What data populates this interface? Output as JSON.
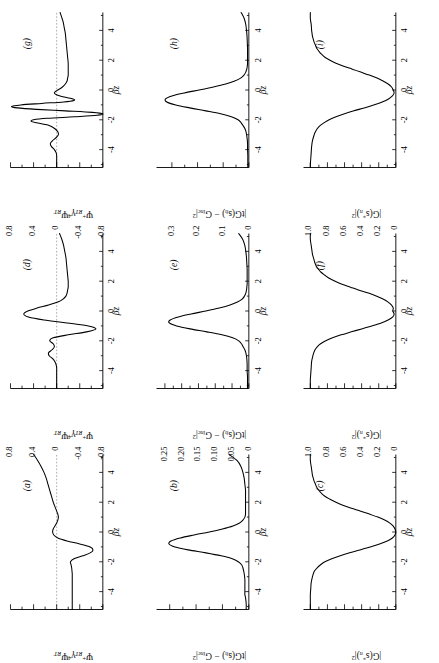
{
  "figure": {
    "type": "multi-panel-scientific-plot",
    "rotation_deg": -90,
    "grid": {
      "rows": 3,
      "cols": 3
    },
    "xlabel": "βz",
    "x_ticks": [
      "-4",
      "-2",
      "0",
      "2",
      "4"
    ],
    "xlim": [
      -5.2,
      5.2
    ]
  },
  "chart_data": [
    {
      "id": "a",
      "type": "line",
      "tag": "(a)",
      "title": "",
      "xlabel": "βz",
      "ylabel_html": "Ψ<sup>+</sup><sub>RT</sub>γ<sup class=\"up\">4</sup>Ψ<sub>RT</sub>",
      "ylabel_text": "Ψ+RT γ4 ΨRT",
      "xlim": [
        -5.2,
        5.2
      ],
      "ylim": [
        -0.8,
        0.8
      ],
      "y_ticks": [
        "0.8",
        "0.4",
        "0",
        "-0.4",
        "-0.8"
      ],
      "y_tick_values": [
        0.8,
        0.4,
        0,
        -0.4,
        -0.8
      ],
      "zero_reference_line": true,
      "x": [
        -5.2,
        -4.8,
        -4.4,
        -4.0,
        -3.6,
        -3.2,
        -3.0,
        -2.8,
        -2.6,
        -2.4,
        -2.2,
        -2.0,
        -1.8,
        -1.6,
        -1.4,
        -1.2,
        -1.0,
        -0.8,
        -0.6,
        -0.4,
        -0.2,
        0.0,
        0.2,
        0.4,
        0.6,
        0.8,
        1.0,
        1.2,
        1.4,
        1.6,
        1.8,
        2.0,
        2.4,
        2.8,
        3.2,
        3.6,
        4.0,
        4.4,
        4.8,
        5.2
      ],
      "y": [
        -0.27,
        -0.27,
        -0.27,
        -0.27,
        -0.27,
        -0.27,
        -0.27,
        -0.27,
        -0.265,
        -0.26,
        -0.25,
        -0.24,
        -0.3,
        -0.45,
        -0.58,
        -0.63,
        -0.58,
        -0.4,
        -0.18,
        -0.02,
        0.05,
        0.07,
        0.06,
        0.03,
        0.0,
        -0.02,
        -0.03,
        -0.02,
        0.0,
        0.02,
        0.04,
        0.06,
        0.09,
        0.12,
        0.15,
        0.18,
        0.22,
        0.27,
        0.33,
        0.4
      ]
    },
    {
      "id": "b",
      "type": "line",
      "tag": "(b)",
      "xlabel": "βz",
      "ylabel_html": "|tG(s<sub>h</sub>) − G<sub>inc</sub>|<sup>2</sup>",
      "ylabel_text": "|tG(s_h) - G_inc|^2",
      "xlim": [
        -5.2,
        5.2
      ],
      "ylim": [
        0,
        0.14
      ],
      "y_ticks": [
        "0.12",
        "0.08",
        "0.04",
        "0"
      ],
      "y_tick_values": [
        0.12,
        0.08,
        0.04,
        0
      ],
      "zero_reference_line": false,
      "x": [
        -5.2,
        -4.8,
        -4.4,
        -4.2,
        -4.0,
        -3.6,
        -3.2,
        -2.8,
        -2.4,
        -2.2,
        -2.0,
        -1.8,
        -1.6,
        -1.4,
        -1.2,
        -1.0,
        -0.8,
        -0.6,
        -0.4,
        -0.2,
        0.0,
        0.2,
        0.4,
        0.6,
        0.8,
        1.0,
        1.2,
        1.4,
        1.6,
        1.8,
        2.0,
        2.4,
        2.8,
        3.2,
        3.6,
        4.0,
        4.4,
        4.8,
        5.2
      ],
      "y": [
        0.004,
        0.004,
        0.005,
        0.006,
        0.006,
        0.006,
        0.006,
        0.007,
        0.009,
        0.011,
        0.016,
        0.025,
        0.042,
        0.065,
        0.092,
        0.112,
        0.121,
        0.118,
        0.104,
        0.083,
        0.06,
        0.04,
        0.024,
        0.014,
        0.009,
        0.006,
        0.005,
        0.005,
        0.005,
        0.005,
        0.005,
        0.005,
        0.005,
        0.006,
        0.007,
        0.009,
        0.012,
        0.018,
        0.03
      ]
    },
    {
      "id": "c",
      "type": "line",
      "tag": "(c)",
      "xlabel": "βz",
      "ylabel_html": "|G(s<sup>*</sup><sub>n</sub>)|<sup>2</sup>",
      "ylabel_text": "|G(s*_n)|^2",
      "xlim": [
        -5.2,
        5.2
      ],
      "ylim": [
        0,
        1.08
      ],
      "y_ticks": [
        "1.0",
        "0.8",
        "0.6",
        "0.4",
        "0.2",
        "0"
      ],
      "y_tick_values": [
        1.0,
        0.8,
        0.6,
        0.4,
        0.2,
        0
      ],
      "zero_reference_line": false,
      "x": [
        -5.2,
        -5.0,
        -4.6,
        -4.2,
        -3.8,
        -3.4,
        -3.0,
        -2.8,
        -2.6,
        -2.4,
        -2.2,
        -2.0,
        -1.8,
        -1.6,
        -1.4,
        -1.2,
        -1.0,
        -0.8,
        -0.6,
        -0.4,
        -0.2,
        0.0,
        0.2,
        0.4,
        0.6,
        0.8,
        1.0,
        1.2,
        1.4,
        1.6,
        1.8,
        2.0,
        2.2,
        2.4,
        2.6,
        2.8,
        3.0,
        3.2,
        3.4,
        3.6,
        3.8,
        4.0,
        4.4,
        4.8,
        5.2
      ],
      "y": [
        1.0,
        1.0,
        1.0,
        1.0,
        0.995,
        0.99,
        0.975,
        0.965,
        0.95,
        0.92,
        0.88,
        0.83,
        0.75,
        0.65,
        0.54,
        0.42,
        0.3,
        0.19,
        0.1,
        0.04,
        0.01,
        0.0,
        0.01,
        0.03,
        0.07,
        0.13,
        0.21,
        0.31,
        0.41,
        0.52,
        0.62,
        0.7,
        0.77,
        0.83,
        0.87,
        0.9,
        0.925,
        0.94,
        0.955,
        0.965,
        0.975,
        0.98,
        0.99,
        1.0,
        1.0
      ]
    },
    {
      "id": "d",
      "type": "line",
      "tag": "(d)",
      "xlabel": "βz",
      "ylabel_html": "Ψ<sup>+</sup><sub>RT</sub>γ<sup class=\"up\">4</sup>Ψ<sub>RT</sub>",
      "ylabel_text": "Ψ+RT γ4 ΨRT",
      "xlim": [
        -5.2,
        5.2
      ],
      "ylim": [
        -0.8,
        0.8
      ],
      "y_ticks": [
        "0.8",
        "0.4",
        "0",
        "-0.4",
        "-0.8"
      ],
      "y_tick_values": [
        0.8,
        0.4,
        0,
        -0.4,
        -0.8
      ],
      "zero_reference_line": true,
      "x": [
        -5.2,
        -4.6,
        -4.2,
        -3.8,
        -3.6,
        -3.4,
        -3.2,
        -3.0,
        -2.8,
        -2.6,
        -2.4,
        -2.2,
        -2.0,
        -1.8,
        -1.6,
        -1.4,
        -1.2,
        -1.0,
        -0.8,
        -0.6,
        -0.4,
        -0.2,
        0.0,
        0.2,
        0.4,
        0.6,
        0.8,
        1.0,
        1.2,
        1.4,
        1.6,
        1.8,
        2.0,
        2.4,
        2.8,
        3.2,
        3.6,
        4.0,
        4.4,
        4.8,
        5.2
      ],
      "y": [
        0.0,
        0.0,
        0.0,
        0.0,
        0.01,
        0.03,
        0.07,
        0.13,
        0.14,
        0.08,
        0.04,
        0.06,
        0.12,
        0.06,
        -0.2,
        -0.52,
        -0.68,
        -0.55,
        -0.18,
        0.22,
        0.49,
        0.57,
        0.5,
        0.34,
        0.14,
        -0.02,
        -0.11,
        -0.16,
        -0.18,
        -0.19,
        -0.2,
        -0.2,
        -0.2,
        -0.19,
        -0.18,
        -0.17,
        -0.16,
        -0.14,
        -0.12,
        -0.09,
        -0.05
      ]
    },
    {
      "id": "e",
      "type": "line",
      "tag": "(e)",
      "xlabel": "βz",
      "ylabel_html": "|tG(s<sub>h</sub>) − G<sub>inc</sub>|<sup>2</sup>",
      "ylabel_text": "|tG(s_h) - G_inc|^2",
      "xlim": [
        -5.2,
        5.2
      ],
      "ylim": [
        0,
        0.275
      ],
      "y_ticks": [
        "0.25",
        "0.20",
        "0.15",
        "0.10",
        "0.05",
        "0"
      ],
      "y_tick_values": [
        0.25,
        0.2,
        0.15,
        0.1,
        0.05,
        0
      ],
      "zero_reference_line": false,
      "x": [
        -5.2,
        -4.8,
        -4.4,
        -4.0,
        -3.6,
        -3.2,
        -2.8,
        -2.6,
        -2.4,
        -2.2,
        -2.0,
        -1.8,
        -1.6,
        -1.4,
        -1.2,
        -1.0,
        -0.8,
        -0.6,
        -0.4,
        -0.2,
        0.0,
        0.2,
        0.4,
        0.6,
        0.8,
        1.0,
        1.2,
        1.4,
        1.6,
        1.8,
        2.0,
        2.4,
        2.8,
        3.2,
        3.6,
        4.0,
        4.4,
        4.8,
        5.2
      ],
      "y": [
        0.004,
        0.004,
        0.004,
        0.005,
        0.005,
        0.006,
        0.009,
        0.012,
        0.017,
        0.022,
        0.03,
        0.048,
        0.08,
        0.125,
        0.175,
        0.215,
        0.237,
        0.234,
        0.21,
        0.172,
        0.128,
        0.088,
        0.056,
        0.034,
        0.02,
        0.013,
        0.009,
        0.007,
        0.006,
        0.005,
        0.005,
        0.005,
        0.005,
        0.006,
        0.007,
        0.009,
        0.012,
        0.018,
        0.03
      ]
    },
    {
      "id": "f",
      "type": "line",
      "tag": "(f)",
      "xlabel": "βz",
      "ylabel_html": "|G(s<sup>*</sup><sub>n</sub>)|<sup>2</sup>",
      "ylabel_text": "|G(s*_n)|^2",
      "xlim": [
        -5.2,
        5.2
      ],
      "ylim": [
        0,
        1.08
      ],
      "y_ticks": [
        "1.0",
        "0.8",
        "0.6",
        "0.4",
        "0.2",
        "0"
      ],
      "y_tick_values": [
        1.0,
        0.8,
        0.6,
        0.4,
        0.2,
        0
      ],
      "zero_reference_line": false,
      "x": [
        -5.2,
        -5.0,
        -4.6,
        -4.2,
        -3.8,
        -3.4,
        -3.0,
        -2.8,
        -2.6,
        -2.4,
        -2.2,
        -2.0,
        -1.8,
        -1.6,
        -1.4,
        -1.2,
        -1.0,
        -0.8,
        -0.6,
        -0.4,
        -0.2,
        0.0,
        0.2,
        0.4,
        0.6,
        0.8,
        1.0,
        1.2,
        1.4,
        1.6,
        1.8,
        2.0,
        2.2,
        2.4,
        2.6,
        2.8,
        3.0,
        3.2,
        3.4,
        3.6,
        3.8,
        4.0,
        4.4,
        4.8,
        5.2
      ],
      "y": [
        1.0,
        1.0,
        1.0,
        0.995,
        0.99,
        0.985,
        0.97,
        0.96,
        0.945,
        0.92,
        0.88,
        0.82,
        0.74,
        0.64,
        0.52,
        0.4,
        0.28,
        0.17,
        0.09,
        0.035,
        0.02,
        0.035,
        0.03,
        0.05,
        0.09,
        0.15,
        0.23,
        0.32,
        0.43,
        0.53,
        0.63,
        0.71,
        0.78,
        0.83,
        0.875,
        0.905,
        0.93,
        0.945,
        0.955,
        0.965,
        0.975,
        0.98,
        0.99,
        1.0,
        1.0
      ]
    },
    {
      "id": "g",
      "type": "line",
      "tag": "(g)",
      "xlabel": "βz",
      "ylabel_html": "Ψ<sup>+</sup><sub>RT</sub>γ<sup class=\"up\">4</sup>Ψ<sub>RT</sub>",
      "ylabel_text": "Ψ+RT γ4 ΨRT",
      "xlim": [
        -5.2,
        5.2
      ],
      "ylim": [
        -0.8,
        0.8
      ],
      "y_ticks": [
        "0.8",
        "0.4",
        "0",
        "-0.4",
        "-0.8"
      ],
      "y_tick_values": [
        0.8,
        0.4,
        0,
        -0.4,
        -0.8
      ],
      "zero_reference_line": true,
      "x": [
        -5.2,
        -4.8,
        -4.4,
        -4.2,
        -4.0,
        -3.8,
        -3.6,
        -3.4,
        -3.2,
        -3.0,
        -2.8,
        -2.6,
        -2.4,
        -2.3,
        -2.2,
        -2.1,
        -2.0,
        -1.9,
        -1.8,
        -1.7,
        -1.6,
        -1.5,
        -1.4,
        -1.3,
        -1.2,
        -1.1,
        -1.0,
        -0.9,
        -0.8,
        -0.7,
        -0.6,
        -0.5,
        -0.4,
        -0.3,
        -0.2,
        -0.1,
        0.0,
        0.2,
        0.4,
        0.6,
        0.8,
        1.0,
        1.4,
        1.8,
        2.2,
        2.6,
        3.0,
        3.4,
        3.8,
        4.2,
        4.6,
        5.2
      ],
      "y": [
        0.0,
        0.0,
        0.0,
        0.01,
        0.04,
        0.09,
        0.11,
        0.07,
        0.01,
        -0.03,
        -0.02,
        0.03,
        0.12,
        0.22,
        0.35,
        0.44,
        0.4,
        0.16,
        -0.3,
        -0.7,
        -0.8,
        -0.62,
        -0.15,
        0.35,
        0.68,
        0.78,
        0.62,
        0.26,
        -0.12,
        -0.3,
        -0.28,
        -0.17,
        -0.06,
        0.01,
        0.04,
        0.02,
        -0.02,
        -0.1,
        -0.15,
        -0.18,
        -0.19,
        -0.2,
        -0.2,
        -0.2,
        -0.19,
        -0.18,
        -0.17,
        -0.16,
        -0.15,
        -0.13,
        -0.11,
        -0.06
      ]
    },
    {
      "id": "h",
      "type": "line",
      "tag": "(h)",
      "xlabel": "βz",
      "ylabel_html": "|tG(s<sub>h</sub>) − G<sub>inc</sub>|<sup>2</sup>",
      "ylabel_text": "|tG(s_h) - G_inc|^2",
      "xlim": [
        -5.2,
        5.2
      ],
      "ylim": [
        0,
        0.36
      ],
      "y_ticks": [
        "0.3",
        "0.2",
        "0.1",
        "0"
      ],
      "y_tick_values": [
        0.3,
        0.2,
        0.1,
        0
      ],
      "zero_reference_line": false,
      "x": [
        -5.2,
        -4.8,
        -4.4,
        -4.0,
        -3.6,
        -3.2,
        -2.8,
        -2.6,
        -2.4,
        -2.2,
        -2.0,
        -1.8,
        -1.6,
        -1.4,
        -1.2,
        -1.0,
        -0.8,
        -0.6,
        -0.4,
        -0.2,
        0.0,
        0.2,
        0.4,
        0.6,
        0.8,
        1.0,
        1.2,
        1.4,
        1.6,
        1.8,
        2.0,
        2.4,
        2.8,
        3.2,
        3.6,
        4.0,
        4.4,
        4.8,
        5.2
      ],
      "y": [
        0.004,
        0.004,
        0.004,
        0.005,
        0.005,
        0.007,
        0.011,
        0.015,
        0.022,
        0.03,
        0.042,
        0.068,
        0.11,
        0.168,
        0.23,
        0.285,
        0.32,
        0.325,
        0.3,
        0.252,
        0.194,
        0.138,
        0.09,
        0.055,
        0.032,
        0.019,
        0.012,
        0.008,
        0.006,
        0.005,
        0.005,
        0.005,
        0.005,
        0.006,
        0.007,
        0.009,
        0.012,
        0.018,
        0.03
      ]
    },
    {
      "id": "i",
      "type": "line",
      "tag": "(i)",
      "xlabel": "βz",
      "ylabel_html": "|G(s<sup>*</sup><sub>n</sub>)|<sup>2</sup>",
      "ylabel_text": "|G(s*_n)|^2",
      "xlim": [
        -5.2,
        5.2
      ],
      "ylim": [
        0,
        1.08
      ],
      "y_ticks": [
        "1.0",
        "0.8",
        "0.6",
        "0.4",
        "0.2",
        "0"
      ],
      "y_tick_values": [
        1.0,
        0.8,
        0.6,
        0.4,
        0.2,
        0
      ],
      "zero_reference_line": false,
      "x": [
        -5.2,
        -5.0,
        -4.6,
        -4.2,
        -3.8,
        -3.4,
        -3.0,
        -2.8,
        -2.6,
        -2.4,
        -2.2,
        -2.0,
        -1.8,
        -1.6,
        -1.4,
        -1.2,
        -1.0,
        -0.8,
        -0.6,
        -0.4,
        -0.2,
        0.0,
        0.2,
        0.4,
        0.6,
        0.8,
        1.0,
        1.2,
        1.4,
        1.6,
        1.8,
        2.0,
        2.2,
        2.4,
        2.6,
        2.8,
        3.0,
        3.2,
        3.4,
        3.6,
        3.8,
        4.0,
        4.4,
        4.8,
        5.2
      ],
      "y": [
        1.0,
        1.0,
        0.995,
        0.99,
        0.985,
        0.975,
        0.955,
        0.94,
        0.92,
        0.89,
        0.84,
        0.78,
        0.7,
        0.6,
        0.49,
        0.37,
        0.26,
        0.16,
        0.085,
        0.04,
        0.02,
        0.03,
        0.05,
        0.09,
        0.15,
        0.22,
        0.31,
        0.41,
        0.51,
        0.61,
        0.7,
        0.77,
        0.83,
        0.87,
        0.9,
        0.925,
        0.94,
        0.955,
        0.965,
        0.975,
        0.98,
        0.985,
        0.99,
        1.0,
        1.0
      ]
    }
  ]
}
